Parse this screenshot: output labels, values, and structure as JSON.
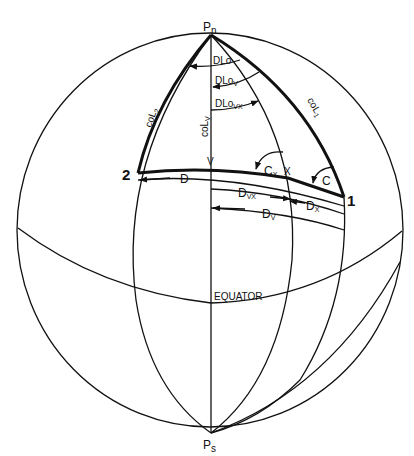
{
  "diagram": {
    "colors": {
      "background": "#ffffff",
      "ink": "#111111"
    },
    "points": {
      "north_pole": {
        "label": "P",
        "subscript": "n"
      },
      "south_pole": {
        "label": "P",
        "subscript": "s"
      },
      "point_1": {
        "label": "1"
      },
      "point_2": {
        "label": "2"
      },
      "vertex": {
        "label": "V"
      },
      "point_x": {
        "label": "X"
      }
    },
    "sides": {
      "colatitude_1": {
        "label": "coL",
        "subscript": "1"
      },
      "colatitude_2": {
        "label": "coL",
        "subscript": "2"
      },
      "colatitude_v": {
        "label": "coL",
        "subscript": "V"
      }
    },
    "angles": {
      "dlo": {
        "label": "DLo"
      },
      "dlo_v": {
        "label": "DLo",
        "subscript": "V"
      },
      "dlo_vx": {
        "label": "DLo",
        "subscript": "VX"
      },
      "course_c": {
        "label": "C"
      },
      "course_cx": {
        "label": "C",
        "subscript": "X"
      }
    },
    "distances": {
      "d": {
        "label": "D"
      },
      "d_vx": {
        "label": "D",
        "subscript": "VX"
      },
      "d_x": {
        "label": "D",
        "subscript": "X"
      },
      "d_v": {
        "label": "D",
        "subscript": "V"
      }
    },
    "equator": {
      "label": "EQUATOR"
    }
  }
}
